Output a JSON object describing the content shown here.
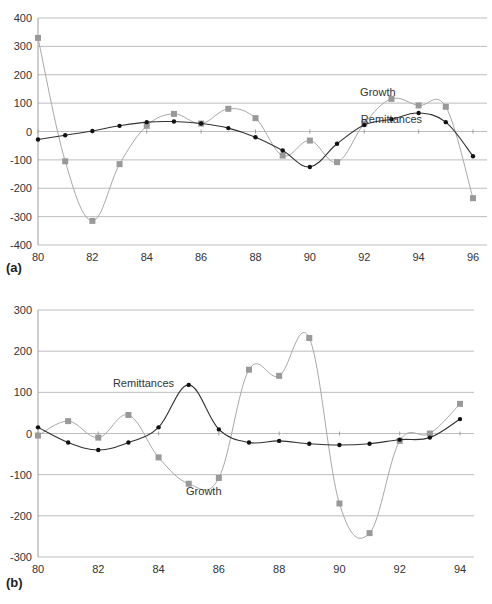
{
  "chart_data": [
    {
      "panel": "(a)",
      "type": "line",
      "title": "",
      "xlabel": "",
      "ylabel": "",
      "ylim": [
        -400,
        400
      ],
      "xlim": [
        80,
        96
      ],
      "yticks": [
        400,
        300,
        200,
        100,
        0,
        -100,
        -200,
        -300,
        -400
      ],
      "xticks": [
        80,
        82,
        84,
        86,
        88,
        90,
        92,
        94,
        96
      ],
      "grid": true,
      "x": [
        80,
        81,
        82,
        83,
        84,
        85,
        86,
        87,
        88,
        89,
        90,
        91,
        92,
        93,
        94,
        95,
        96
      ],
      "series": [
        {
          "name": "Growth",
          "color": "#a8a8a8",
          "marker": "square",
          "values": [
            330,
            -105,
            -315,
            -115,
            20,
            62,
            28,
            80,
            47,
            -85,
            -32,
            -108,
            28,
            115,
            92,
            87,
            -235
          ]
        },
        {
          "name": "Remittances",
          "color": "#333333",
          "marker": "diamond",
          "values": [
            -28,
            -13,
            2,
            20,
            33,
            35,
            28,
            12,
            -20,
            -67,
            -125,
            -43,
            23,
            43,
            65,
            33,
            -87
          ]
        }
      ],
      "annotations": [
        {
          "text": "Growth",
          "x": 92.5,
          "y": 125
        },
        {
          "text": "Remittances",
          "x": 93,
          "y": 30
        }
      ]
    },
    {
      "panel": "(b)",
      "type": "line",
      "title": "",
      "xlabel": "",
      "ylabel": "",
      "ylim": [
        -300,
        300
      ],
      "xlim": [
        80,
        94
      ],
      "yticks": [
        300,
        200,
        100,
        0,
        -100,
        -200,
        -300
      ],
      "xticks": [
        80,
        82,
        84,
        86,
        88,
        90,
        92,
        94
      ],
      "grid": true,
      "x": [
        80,
        81,
        82,
        83,
        84,
        85,
        86,
        87,
        88,
        89,
        90,
        91,
        92,
        93,
        94
      ],
      "series": [
        {
          "name": "Growth",
          "color": "#a8a8a8",
          "marker": "square",
          "values": [
            -5,
            30,
            -10,
            45,
            -58,
            -122,
            -108,
            155,
            140,
            232,
            -170,
            -242,
            -18,
            0,
            72
          ]
        },
        {
          "name": "Remittances",
          "color": "#333333",
          "marker": "diamond",
          "values": [
            15,
            -22,
            -40,
            -22,
            15,
            118,
            10,
            -22,
            -18,
            -25,
            -28,
            -25,
            -15,
            -10,
            35
          ]
        }
      ],
      "annotations": [
        {
          "text": "Remittances",
          "x": 83.5,
          "y": 112
        },
        {
          "text": "Growth",
          "x": 85.5,
          "y": -150
        }
      ]
    }
  ],
  "labels": {
    "panel_a": "(a)",
    "panel_b": "(b)",
    "growth": "Growth",
    "remittances": "Remittances"
  }
}
